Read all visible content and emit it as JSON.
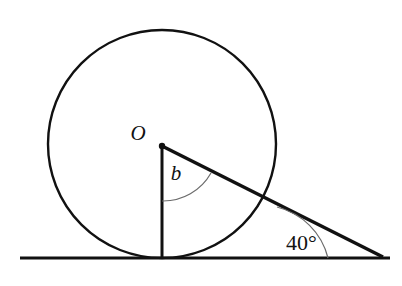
{
  "figure": {
    "type": "geometry-diagram",
    "labels": {
      "center_point": "O",
      "central_angle": "b",
      "base_angle": "40°"
    },
    "colors": {
      "stroke": "#111111",
      "arc_stroke": "#6b6b6b",
      "background": "#ffffff",
      "point_fill": "#111111"
    },
    "geometry": {
      "circle": {
        "cx": 162,
        "cy": 144,
        "r": 114
      },
      "center_dot": {
        "cx": 162,
        "cy": 146,
        "r": 3.2
      },
      "baseline": {
        "x1": 20,
        "y1": 258,
        "x2": 390,
        "y2": 258
      },
      "vertical_radius": {
        "x1": 162,
        "y1": 146,
        "x2": 162,
        "y2": 258
      },
      "slant_line": {
        "x1": 162,
        "y1": 146,
        "x2": 383,
        "y2": 257
      },
      "angle_arc_b": {
        "path": "M 162 201 A 55 55 0 0 0 211 173",
        "radius": 55
      },
      "angle_arc_base": {
        "path": "M 328 258 A 70 70 0 0 0 277 207",
        "radius": 70
      }
    },
    "label_positions": {
      "center_point": {
        "x": 138,
        "y": 140
      },
      "central_angle": {
        "x": 169,
        "y": 180
      },
      "base_angle": {
        "x": 285,
        "y": 250
      }
    },
    "font_sizes": {
      "center_point": 21,
      "central_angle": 21,
      "base_angle": 22
    }
  }
}
